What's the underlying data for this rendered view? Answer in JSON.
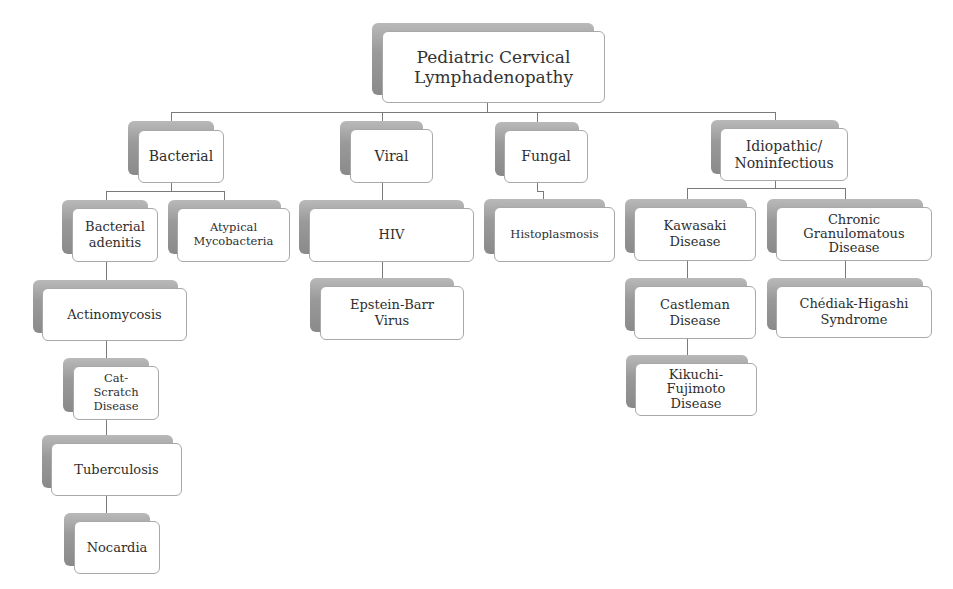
{
  "diagram": {
    "root": "Pediatric Cervical Lymphadenopathy",
    "categories": {
      "bacterial": {
        "label": "Bacterial",
        "children": [
          "Bacterial adenitis",
          "Atypical Mycobacteria",
          "Actinomycosis",
          "Cat-Scratch Disease",
          "Tuberculosis",
          "Nocardia"
        ]
      },
      "viral": {
        "label": "Viral",
        "children": [
          "HIV",
          "Epstein-Barr Virus"
        ]
      },
      "fungal": {
        "label": "Fungal",
        "children": [
          "Histoplasmosis"
        ]
      },
      "idiopathic": {
        "label": "Idiopathic/ Noninfectious",
        "children": [
          "Kawasaki Disease",
          "Chronic Granulomatous Disease",
          "Castleman Disease",
          "Chédiak-Higashi Syndrome",
          "Kikuchi-Fujimoto Disease"
        ]
      }
    }
  }
}
